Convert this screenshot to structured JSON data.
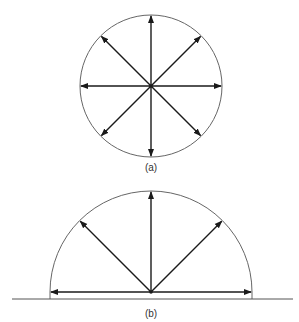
{
  "figure_a": {
    "label": "(a)",
    "shape": "circle",
    "center": [
      151,
      86
    ],
    "radius": 71,
    "arrow_angles_deg": [
      0,
      45,
      90,
      135,
      180,
      225,
      270,
      315
    ]
  },
  "figure_b": {
    "label": "(b)",
    "shape": "semicircle",
    "center": [
      151,
      292
    ],
    "radius": 101,
    "arrow_angles_deg": [
      0,
      45,
      90,
      135,
      180
    ],
    "baseline": {
      "x1": 12,
      "x2": 293,
      "y": 299
    }
  },
  "colors": {
    "circle": "#666666",
    "arrow": "#1a1a1a",
    "baseline": "#555555"
  }
}
